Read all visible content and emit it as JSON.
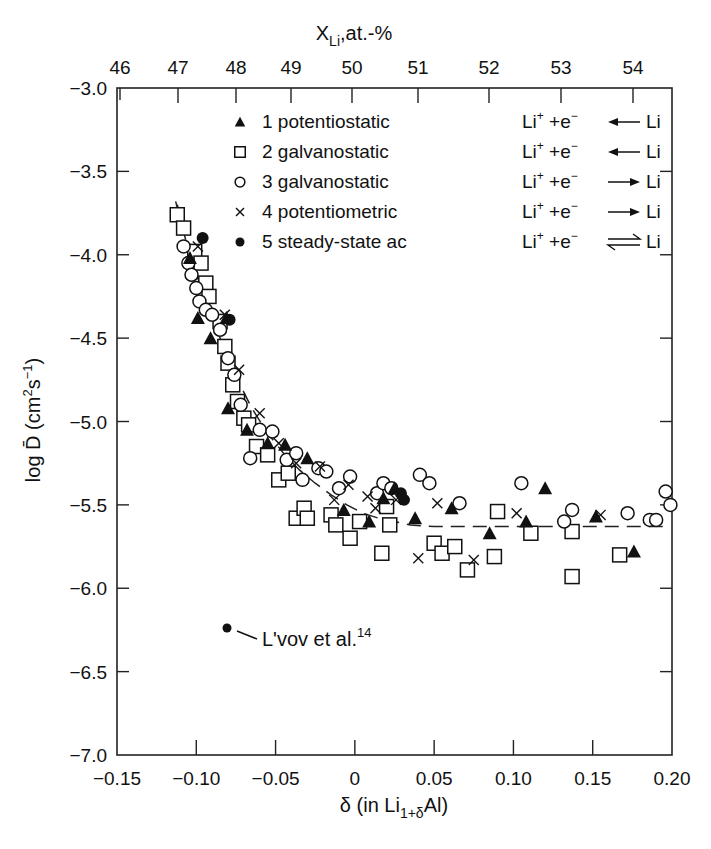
{
  "chart_data": {
    "type": "scatter",
    "title": "",
    "xlabel": "δ (in Li1+δAl)",
    "xlabel_parts": {
      "main": "δ (in Li",
      "sub": "1+δ",
      "tail": "Al)"
    },
    "ylabel": "log D̄ (cm²s⁻¹)",
    "ylabel_parts": {
      "main": "log D̄ (cm",
      "sup1": "2",
      "mid": "s",
      "sup2": "−1",
      "tail": ")"
    },
    "x2label": "XLi,at.-%",
    "x2label_parts": {
      "main": "X",
      "sub": "Li",
      "tail": ",at.-%"
    },
    "xlim": [
      -0.15,
      0.2
    ],
    "ylim": [
      -7.0,
      -3.0
    ],
    "x2lim": [
      46,
      54.5
    ],
    "xticks": [
      -0.15,
      -0.1,
      -0.05,
      0,
      0.05,
      0.1,
      0.15,
      0.2
    ],
    "xtick_labels": [
      "−0.15",
      "−0.10",
      "−0.05",
      "0",
      "0.05",
      "0.10",
      "0.15",
      "0.20"
    ],
    "yticks": [
      -3.0,
      -3.5,
      -4.0,
      -4.5,
      -5.0,
      -5.5,
      -6.0,
      -6.5,
      -7.0
    ],
    "ytick_labels": [
      "−3.0",
      "−3.5",
      "−4.0",
      "−4.5",
      "−5.0",
      "−5.5",
      "−6.0",
      "−6.5",
      "−7.0"
    ],
    "x2ticks_px": [
      120,
      178,
      236,
      291,
      352,
      418,
      489,
      561,
      633
    ],
    "x2tick_labels": [
      "46",
      "47",
      "48",
      "49",
      "50",
      "51",
      "52",
      "53",
      "54"
    ],
    "grid": false,
    "legend_position": "upper-right inside",
    "legend": [
      {
        "marker": "triangle-filled",
        "label": "1 potentiostatic",
        "reaction": "Li⁺ +e⁻ ← Li",
        "arrow": "left"
      },
      {
        "marker": "square-open",
        "label": "2 galvanostatic",
        "reaction": "Li⁺ +e⁻ ← Li",
        "arrow": "left"
      },
      {
        "marker": "circle-open",
        "label": "3 galvanostatic",
        "reaction": "Li⁺ +e⁻ → Li",
        "arrow": "right"
      },
      {
        "marker": "cross",
        "label": "4 potentiometric",
        "reaction": "Li⁺ +e⁻ → Li",
        "arrow": "right"
      },
      {
        "marker": "circle-filled",
        "label": "5 steady-state ac",
        "reaction": "Li⁺ +e⁻ ⇌ Li",
        "arrow": "equilibrium"
      }
    ],
    "reaction_parts": {
      "li": "Li",
      "plus": "+",
      "e": " +e",
      "minus": "−",
      "li2": "Li"
    },
    "annotation": {
      "text": "L'vov et al.",
      "superscript": "14",
      "x": -0.078,
      "y": -6.23
    },
    "trend_line": {
      "style": "dashed",
      "x": [
        -0.112,
        -0.105,
        -0.095,
        -0.085,
        -0.075,
        -0.065,
        -0.055,
        -0.045,
        -0.035,
        -0.025,
        -0.015,
        -0.005,
        0.005,
        0.015,
        0.025,
        0.035,
        0.05,
        0.08,
        0.12,
        0.16,
        0.195
      ],
      "y": [
        -3.7,
        -3.98,
        -4.25,
        -4.5,
        -4.73,
        -4.92,
        -5.07,
        -5.19,
        -5.29,
        -5.37,
        -5.44,
        -5.5,
        -5.55,
        -5.58,
        -5.6,
        -5.62,
        -5.63,
        -5.63,
        -5.63,
        -5.63,
        -5.63
      ]
    },
    "series": [
      {
        "name": "1 potentiostatic",
        "marker": "triangle-filled",
        "x": [
          -0.104,
          -0.099,
          -0.091,
          -0.081,
          -0.08,
          -0.068,
          -0.055,
          -0.044,
          -0.03,
          -0.007,
          0.009,
          0.018,
          0.025,
          0.038,
          0.061,
          0.085,
          0.108,
          0.12,
          0.152,
          0.176
        ],
        "y": [
          -4.02,
          -4.38,
          -4.5,
          -4.38,
          -4.92,
          -5.05,
          -5.13,
          -5.14,
          -5.22,
          -5.53,
          -5.6,
          -5.46,
          -5.4,
          -5.58,
          -5.52,
          -5.67,
          -5.6,
          -5.4,
          -5.57,
          -5.78
        ]
      },
      {
        "name": "2 galvanostatic",
        "marker": "square-open",
        "x": [
          -0.112,
          -0.108,
          -0.101,
          -0.097,
          -0.094,
          -0.092,
          -0.085,
          -0.082,
          -0.08,
          -0.077,
          -0.074,
          -0.07,
          -0.067,
          -0.062,
          -0.055,
          -0.048,
          -0.042,
          -0.037,
          -0.032,
          -0.03,
          -0.015,
          -0.012,
          -0.003,
          0.003,
          0.017,
          0.02,
          0.022,
          0.05,
          0.055,
          0.063,
          0.071,
          0.088,
          0.09,
          0.111,
          0.137,
          0.137,
          0.167
        ],
        "y": [
          -3.76,
          -3.84,
          -3.98,
          -4.05,
          -4.17,
          -4.25,
          -4.4,
          -4.55,
          -4.65,
          -4.78,
          -4.88,
          -4.98,
          -5.02,
          -5.15,
          -5.2,
          -5.35,
          -5.31,
          -5.58,
          -5.52,
          -5.58,
          -5.56,
          -5.62,
          -5.7,
          -5.6,
          -5.79,
          -5.51,
          -5.62,
          -5.73,
          -5.79,
          -5.75,
          -5.89,
          -5.81,
          -5.54,
          -5.67,
          -5.66,
          -5.93,
          -5.8
        ]
      },
      {
        "name": "3 galvanostatic",
        "marker": "circle-open",
        "x": [
          -0.108,
          -0.105,
          -0.103,
          -0.1,
          -0.098,
          -0.094,
          -0.09,
          -0.085,
          -0.08,
          -0.076,
          -0.072,
          -0.066,
          -0.06,
          -0.052,
          -0.043,
          -0.037,
          -0.033,
          -0.023,
          -0.018,
          -0.01,
          -0.003,
          0.014,
          0.018,
          0.023,
          0.041,
          0.047,
          0.066,
          0.105,
          0.132,
          0.137,
          0.172,
          0.186,
          0.19,
          0.196,
          0.199
        ],
        "y": [
          -3.95,
          -4.05,
          -4.12,
          -4.2,
          -4.28,
          -4.33,
          -4.36,
          -4.45,
          -4.62,
          -4.72,
          -4.9,
          -5.22,
          -5.05,
          -5.06,
          -5.23,
          -5.19,
          -5.35,
          -5.28,
          -5.3,
          -5.4,
          -5.33,
          -5.43,
          -5.37,
          -5.4,
          -5.32,
          -5.37,
          -5.49,
          -5.37,
          -5.6,
          -5.53,
          -5.55,
          -5.59,
          -5.59,
          -5.42,
          -5.5
        ]
      },
      {
        "name": "4 potentiometric",
        "marker": "cross",
        "x": [
          -0.099,
          -0.082,
          -0.073,
          -0.06,
          -0.048,
          -0.037,
          -0.022,
          -0.013,
          -0.004,
          0.008,
          0.013,
          0.026,
          0.04,
          0.052,
          0.075,
          0.102,
          0.155
        ],
        "y": [
          -3.95,
          -4.36,
          -4.69,
          -4.95,
          -5.13,
          -5.25,
          -5.27,
          -5.47,
          -5.38,
          -5.45,
          -5.52,
          -5.47,
          -5.82,
          -5.49,
          -5.83,
          -5.55,
          -5.56
        ]
      },
      {
        "name": "5 steady-state ac",
        "marker": "circle-filled",
        "x": [
          -0.096,
          -0.079,
          0.029,
          0.031
        ],
        "y": [
          -3.9,
          -4.39,
          -5.43,
          -5.47
        ]
      }
    ]
  }
}
